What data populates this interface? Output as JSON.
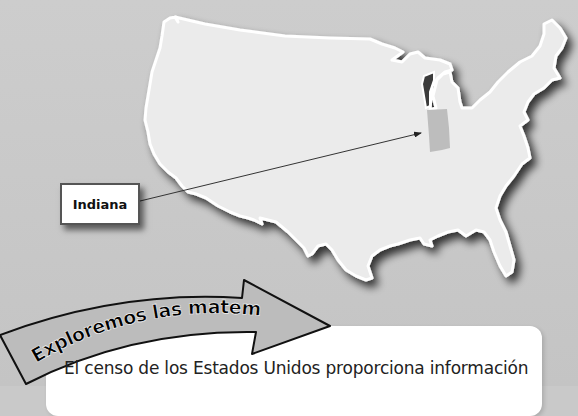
{
  "map": {
    "title": "United States map",
    "highlighted_state": "Indiana",
    "colors": {
      "background": "#c9c9c9",
      "land": "#ebebeb",
      "outline": "#ffffff",
      "highlight": "#bdbdbd",
      "arrow": "#333333"
    }
  },
  "callout": {
    "label": "Indiana"
  },
  "banner": {
    "title": "Exploremos las matemáticas",
    "colors": {
      "fill": "#bcbcbc",
      "stroke": "#111111",
      "text": "#000000"
    }
  },
  "content": {
    "paragraph": "El censo de los Estados Unidos proporciona información"
  }
}
